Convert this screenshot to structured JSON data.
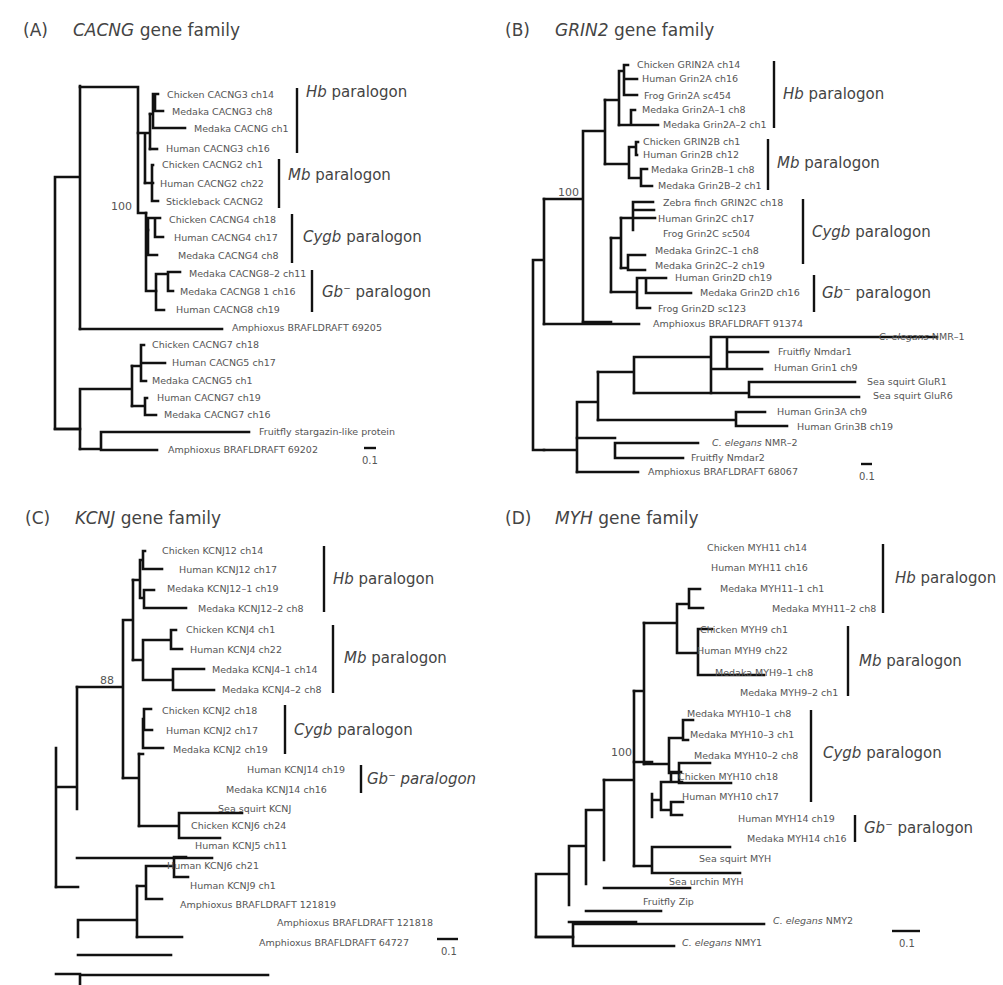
{
  "panels": [
    {
      "id": "A",
      "letter": "(A)",
      "gene": "CACNG",
      "suffix": "gene family",
      "bootstrap": "100",
      "scale": "0.1",
      "groups": [
        {
          "italic": "Hb",
          "text": " paralogon"
        },
        {
          "italic": "Mb",
          "text": " paralogon"
        },
        {
          "italic": "Cygb",
          "text": " paralogon"
        },
        {
          "italic": "Gb",
          "sup": "−",
          "text": " paralogon"
        }
      ],
      "leaves": [
        "Chicken CACNG3 ch14",
        "Medaka CACNG3 ch8",
        "Medaka CACNG ch1",
        "Human CACNG3 ch16",
        "Chicken CACNG2 ch1",
        "Human CACNG2 ch22",
        "Stickleback CACNG2",
        "Chicken CACNG4 ch18",
        "Human CACNG4 ch17",
        "Medaka CACNG4 ch8",
        "Medaka CACNG8–2 ch11",
        "Medaka CACNG8 1 ch16",
        "Human CACNG8 ch19",
        "Amphioxus BRAFLDRAFT 69205",
        "Chicken CACNG7 ch18",
        "Human CACNG5 ch17",
        "Medaka CACNG5 ch1",
        "Human CACNG7 ch19",
        "Medaka CACNG7 ch16",
        "Fruitfly stargazin-like protein",
        "Amphioxus BRAFLDRAFT 69202"
      ]
    },
    {
      "id": "B",
      "letter": "(B)",
      "gene": "GRIN2",
      "suffix": "gene family",
      "bootstrap": "100",
      "scale": "0.1",
      "groups": [
        {
          "italic": "Hb",
          "text": " paralogon"
        },
        {
          "italic": "Mb",
          "text": " paralogon"
        },
        {
          "italic": "Cygb",
          "text": " paralogon"
        },
        {
          "italic": "Gb",
          "sup": "−",
          "text": " paralogon"
        }
      ],
      "leaves": [
        "Chicken GRIN2A ch14",
        "Human Grin2A ch16",
        "Frog Grin2A sc454",
        "Medaka Grin2A–1 ch8",
        "Medaka Grin2A–2 ch1",
        "Chicken GRIN2B ch1",
        "Human Grin2B ch12",
        "Medaka Grin2B–1 ch8",
        "Medaka Grin2B–2 ch1",
        "Zebra finch GRIN2C ch18",
        "Human Grin2C ch17",
        "Frog Grin2C sc504",
        "Medaka Grin2C–1 ch8",
        "Medaka Grin2C–2 ch19",
        "Human Grin2D ch19",
        "Medaka Grin2D ch16",
        "Frog Grin2D sc123",
        "Amphioxus BRAFLDRAFT 91374",
        "C. elegans|NMR–1",
        "Fruitfly Nmdar1",
        "Human Grin1 ch9",
        "Sea squirt GluR1",
        "Sea squirt GluR6",
        "Human Grin3A ch9",
        "Human Grin3B ch19",
        "C. elegans|NMR–2",
        "Fruitfly Nmdar2",
        "Amphioxus BRAFLDRAFT 68067"
      ]
    },
    {
      "id": "C",
      "letter": "(C)",
      "gene": "KCNJ",
      "suffix": "gene family",
      "bootstrap": "88",
      "scale": "0.1",
      "groups": [
        {
          "italic": "Hb",
          "text": " paralogon"
        },
        {
          "italic": "Mb",
          "text": " paralogon"
        },
        {
          "italic": "Cygb",
          "text": " paralogon"
        },
        {
          "italic": "Gb",
          "sup": "−",
          "text": " paralogon",
          "all_italic": true
        }
      ],
      "leaves": [
        "Chicken KCNJ12 ch14",
        "Human KCNJ12 ch17",
        "Medaka KCNJ12–1 ch19",
        "Medaka KCNJ12–2 ch8",
        "Chicken KCNJ4 ch1",
        "Human KCNJ4 ch22",
        "Medaka KCNJ4–1 ch14",
        "Medaka KCNJ4–2 ch8",
        "Chicken KCNJ2 ch18",
        "Human KCNJ2 ch17",
        "Medaka KCNJ2 ch19",
        "Human KCNJ14 ch19",
        "Medaka KCNJ14 ch16",
        "Sea squirt KCNJ",
        "Chicken KCNJ6 ch24",
        "Human KCNJ5 ch11",
        "Human KCNJ6 ch21",
        "Human KCNJ9 ch1",
        "Amphioxus BRAFLDRAFT 121819",
        "Amphioxus BRAFLDRAFT 121818",
        "Amphioxus BRAFLDRAFT 64727"
      ]
    },
    {
      "id": "D",
      "letter": "(D)",
      "gene": "MYH",
      "suffix": "gene family",
      "bootstrap": "100",
      "scale": "0.1",
      "groups": [
        {
          "italic": "Hb",
          "text": " paralogon"
        },
        {
          "italic": "Mb",
          "text": " paralogon"
        },
        {
          "italic": "Cygb",
          "text": " paralogon"
        },
        {
          "italic": "Gb",
          "sup": "−",
          "text": " paralogon"
        }
      ],
      "leaves": [
        "Chicken MYH11 ch14",
        "Human MYH11 ch16",
        "Medaka MYH11–1 ch1",
        "Medaka MYH11–2 ch8",
        "Chicken MYH9 ch1",
        "Human MYH9 ch22",
        "Medaka MYH9–1 ch8",
        "Medaka MYH9–2 ch1",
        "Medaka MYH10–1 ch8",
        "Medaka MYH10–3 ch1",
        "Medaka MYH10–2 ch8",
        "Chicken MYH10 ch18",
        "Human MYH10 ch17",
        "Human MYH14 ch19",
        "Medaka MYH14 ch16",
        "Sea squirt MYH",
        "Sea urchin MYH",
        "Fruitfly Zip",
        "C. elegans|NMY2",
        "C. elegans|NMY1"
      ]
    }
  ]
}
